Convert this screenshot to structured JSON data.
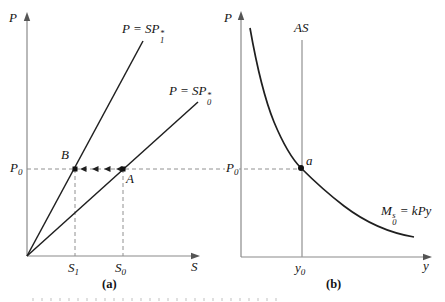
{
  "figure": {
    "panel_a": {
      "caption": "(a)",
      "y_axis_label": "P",
      "x_axis_label": "S",
      "line1": {
        "prefix": "P = SP",
        "sup": "*",
        "sub": "1"
      },
      "line2": {
        "prefix": "P = SP",
        "sup": "*",
        "sub": "0"
      },
      "p0": {
        "base": "P",
        "sub": "0"
      },
      "s1": {
        "base": "S",
        "sub": "1"
      },
      "s0": {
        "base": "S",
        "sub": "0"
      },
      "point_b": "B",
      "point_a": "A"
    },
    "panel_b": {
      "caption": "(b)",
      "y_axis_label": "P",
      "x_axis_label": "y",
      "as_curve": "AS",
      "money_curve": {
        "base": "M",
        "sup": "s",
        "sub": "0",
        "rest": " = kPy"
      },
      "p0": {
        "base": "P",
        "sub": "0"
      },
      "y0": {
        "base": "y",
        "sub": "0"
      },
      "point_a": "a"
    },
    "colors": {
      "axis": "#8a8a8a",
      "curve": "#1f1f1f",
      "dashed": "#909090",
      "text": "#141414"
    }
  }
}
